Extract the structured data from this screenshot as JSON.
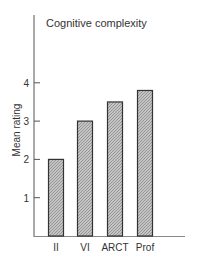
{
  "chart_data": {
    "type": "bar",
    "title": "Cognitive complexity",
    "xlabel": "",
    "ylabel": "Mean rating",
    "categories": [
      "II",
      "VI",
      "ARCT",
      "Prof"
    ],
    "values": [
      2.0,
      3.0,
      3.5,
      3.8
    ],
    "ylim": [
      0,
      4.5
    ],
    "yticks": [
      1,
      2,
      3,
      4
    ],
    "grid": false,
    "legend": null,
    "bar_fill": "hatched gray",
    "colors": {
      "bar_fill": "#a8a8a8",
      "bar_stroke": "#333333",
      "axis": "#555555"
    }
  }
}
